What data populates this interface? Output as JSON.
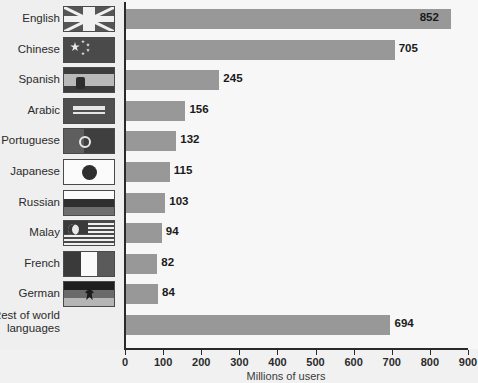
{
  "chart_data": {
    "type": "bar",
    "orientation": "horizontal",
    "title": "",
    "xlabel": "Millions of users",
    "ylabel": "",
    "xlim": [
      0,
      900
    ],
    "xticks": [
      0,
      100,
      200,
      300,
      400,
      500,
      600,
      700,
      800,
      900
    ],
    "grid": false,
    "legend": null,
    "categories": [
      "English",
      "Chinese",
      "Spanish",
      "Arabic",
      "Portuguese",
      "Japanese",
      "Russian",
      "Malay",
      "French",
      "German",
      "Rest of world\nlanguages"
    ],
    "values": [
      852,
      705,
      245,
      156,
      132,
      115,
      103,
      94,
      82,
      84,
      694
    ],
    "bar_color": "#989898",
    "axis_color": "#2a2a2a",
    "plot_background": "#f7f7f7",
    "page_background": "#f1f1f1",
    "rows": [
      {
        "label": "English",
        "value": 852,
        "value_text": "852",
        "flag": "flag-united-kingdom",
        "flag_class": "f-uk",
        "label_inside": true
      },
      {
        "label": "Chinese",
        "value": 705,
        "value_text": "705",
        "flag": "flag-china",
        "flag_class": "f-cn",
        "label_inside": false
      },
      {
        "label": "Spanish",
        "value": 245,
        "value_text": "245",
        "flag": "flag-spain",
        "flag_class": "f-es",
        "label_inside": false
      },
      {
        "label": "Arabic",
        "value": 156,
        "value_text": "156",
        "flag": "flag-saudi-arabia",
        "flag_class": "f-sa",
        "label_inside": false
      },
      {
        "label": "Portuguese",
        "value": 132,
        "value_text": "132",
        "flag": "flag-portugal",
        "flag_class": "f-pt",
        "label_inside": false
      },
      {
        "label": "Japanese",
        "value": 115,
        "value_text": "115",
        "flag": "flag-japan",
        "flag_class": "f-jp",
        "label_inside": false
      },
      {
        "label": "Russian",
        "value": 103,
        "value_text": "103",
        "flag": "flag-russia",
        "flag_class": "f-ru",
        "label_inside": false
      },
      {
        "label": "Malay",
        "value": 94,
        "value_text": "94",
        "flag": "flag-malaysia",
        "flag_class": "f-my",
        "label_inside": false
      },
      {
        "label": "French",
        "value": 82,
        "value_text": "82",
        "flag": "flag-france",
        "flag_class": "f-fr",
        "label_inside": false
      },
      {
        "label": "German",
        "value": 84,
        "value_text": "84",
        "flag": "flag-germany",
        "flag_class": "f-de",
        "label_inside": false
      },
      {
        "label": "Rest of world\nlanguages",
        "value": 694,
        "value_text": "694",
        "flag": null,
        "flag_class": null,
        "label_inside": false
      }
    ]
  }
}
